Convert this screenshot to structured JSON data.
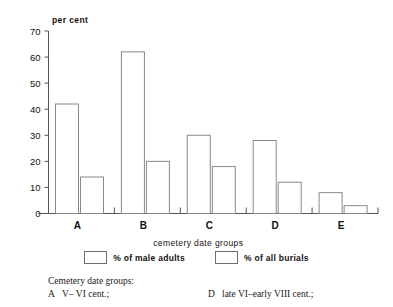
{
  "chart_data": {
    "type": "bar",
    "title": "",
    "ylabel": "per cent",
    "xlabel": "cemetery date groups",
    "categories": [
      "A",
      "B",
      "C",
      "D",
      "E"
    ],
    "ylim": [
      0,
      70
    ],
    "yticks": [
      0,
      10,
      20,
      30,
      40,
      50,
      60,
      70
    ],
    "ytick_labels": [
      "0",
      "10",
      "20",
      "30",
      "40",
      "50",
      "60",
      "70"
    ],
    "grid": false,
    "legend_position": "bottom-center",
    "series": [
      {
        "name": "% of male adults",
        "values": [
          42,
          62,
          30,
          28,
          8
        ]
      },
      {
        "name": "% of all burials",
        "values": [
          14,
          20,
          18,
          12,
          3
        ]
      }
    ]
  },
  "legend": {
    "items": [
      {
        "label": "% of male adults"
      },
      {
        "label": "% of all burials"
      }
    ]
  },
  "notes": {
    "title": "Cemetery date groups:",
    "left": [
      {
        "key": "A",
        "value": "V– VI cent.;"
      }
    ],
    "right": [
      {
        "key": "D",
        "value": "late VI–early VIII cent.;"
      }
    ]
  }
}
